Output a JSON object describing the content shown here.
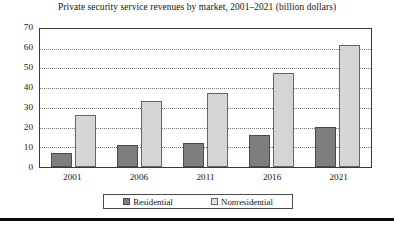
{
  "chart_data": {
    "type": "bar",
    "title": "Private security service revenues by market, 2001–2021 (billion dollars)",
    "xlabel": "",
    "ylabel": "",
    "ylim": [
      0,
      70
    ],
    "yticks": [
      0,
      10,
      20,
      30,
      40,
      50,
      60,
      70
    ],
    "grid": true,
    "legend_position": "bottom",
    "categories": [
      "2001",
      "2006",
      "2011",
      "2016",
      "2021"
    ],
    "series": [
      {
        "name": "Residential",
        "color": "#7e7e7e",
        "values": [
          7,
          11,
          12,
          16,
          20
        ]
      },
      {
        "name": "Nonresidential",
        "color": "#d5d5d5",
        "values": [
          26,
          33,
          37,
          47,
          61
        ]
      }
    ]
  },
  "legend": {
    "items": [
      {
        "label": "Residential",
        "swatch": "residential"
      },
      {
        "label": "Nonresidential",
        "swatch": "nonresidential"
      }
    ]
  }
}
